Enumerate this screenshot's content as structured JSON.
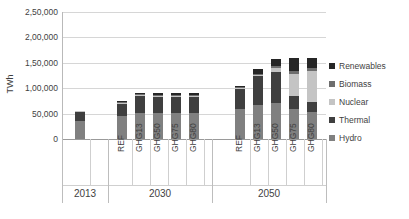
{
  "chart_data": {
    "type": "bar",
    "title": "",
    "xlabel": "",
    "ylabel": "TWh",
    "ylim": [
      0,
      250000
    ],
    "yticks": [
      0,
      50000,
      100000,
      150000,
      200000,
      250000
    ],
    "ytick_labels": [
      "0",
      "50,000",
      "1,00,000",
      "1,50,000",
      "2,00,000",
      "2,50,000"
    ],
    "grid": true,
    "stacked": true,
    "legend_position": "right",
    "groups": [
      {
        "label": "2013",
        "categories": [
          "2013"
        ]
      },
      {
        "label": "2030",
        "categories": [
          "REF",
          "GHG13",
          "GHG50",
          "GHG75",
          "GHG80"
        ]
      },
      {
        "label": "2050",
        "categories": [
          "REF",
          "GHG13",
          "GHG50",
          "GHG75",
          "GHG80"
        ]
      }
    ],
    "categories": [
      "2013",
      "REF",
      "GHG13",
      "GHG50",
      "GHG75",
      "GHG80",
      "REF",
      "GHG13",
      "GHG50",
      "GHG75",
      "GHG80"
    ],
    "legend": [
      "Renewables",
      "Biomass",
      "Nuclear",
      "Thermal",
      "Hydro"
    ],
    "series": [
      {
        "name": "Hydro",
        "color": "#808080",
        "values": [
          36000,
          46000,
          52000,
          52000,
          52000,
          52000,
          60000,
          66000,
          70000,
          60000,
          54000
        ]
      },
      {
        "name": "Thermal",
        "color": "#3f3f3f",
        "values": [
          17000,
          22000,
          32000,
          31000,
          30000,
          30000,
          38000,
          58000,
          62000,
          24000,
          18000
        ]
      },
      {
        "name": "Nuclear",
        "color": "#c4c4c4",
        "values": [
          1000,
          1000,
          2000,
          2000,
          3000,
          3000,
          2000,
          3000,
          8000,
          44000,
          62000
        ]
      },
      {
        "name": "Biomass",
        "color": "#6e6e6e",
        "values": [
          0,
          500,
          1000,
          1000,
          1000,
          1000,
          1000,
          2000,
          4000,
          6000,
          6000
        ]
      },
      {
        "name": "Renewables",
        "color": "#262626",
        "values": [
          0,
          1500,
          3000,
          3000,
          4000,
          4000,
          2000,
          9000,
          14000,
          26000,
          20000
        ]
      }
    ],
    "colors": {
      "renewables": "#262626",
      "biomass": "#6e6e6e",
      "nuclear": "#c4c4c4",
      "thermal": "#3f3f3f",
      "hydro": "#808080",
      "gridline": "#d6d6d6",
      "axis": "#9a9a9a",
      "text": "#3f3f3f"
    }
  }
}
